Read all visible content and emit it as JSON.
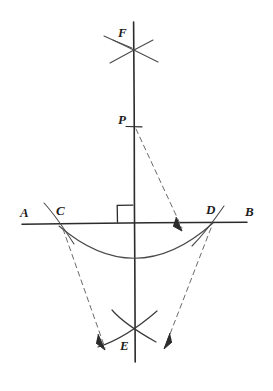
{
  "diagram": {
    "ink_color": "#2b2b2b",
    "label_color": "#1c1c1c",
    "background_color": "#ffffff",
    "canvas": {
      "width": 273,
      "height": 391
    },
    "labels": [
      {
        "id": "F",
        "text": "F",
        "x": 118,
        "y": 26,
        "desc": "upper-arc-intersection-label"
      },
      {
        "id": "P",
        "text": "P",
        "x": 118,
        "y": 113,
        "desc": "point-p-label"
      },
      {
        "id": "A",
        "text": "A",
        "x": 20,
        "y": 206,
        "desc": "line-end-a-label"
      },
      {
        "id": "C",
        "text": "C",
        "x": 56,
        "y": 204,
        "desc": "arc-intersection-c-label"
      },
      {
        "id": "D",
        "text": "D",
        "x": 206,
        "y": 203,
        "desc": "arc-intersection-d-label"
      },
      {
        "id": "B",
        "text": "B",
        "x": 245,
        "y": 205,
        "desc": "line-end-b-label"
      },
      {
        "id": "E",
        "text": "E",
        "x": 120,
        "y": 339,
        "desc": "lower-arc-intersection-label"
      }
    ],
    "elements": {
      "line_ab": {
        "name": "horizontal-line-ab",
        "x1": 22,
        "y1": 224,
        "x2": 247,
        "y2": 222
      },
      "line_fe": {
        "name": "vertical-line-fe",
        "x1": 134,
        "y1": 22,
        "x2": 135,
        "y2": 362
      },
      "right_angle_mark": {
        "name": "right-angle-marker",
        "x": 117,
        "y": 205,
        "w": 16,
        "h": 18
      },
      "arc_cd": {
        "name": "arc-through-c-and-d",
        "from_x": 59,
        "from_y": 226,
        "to_x": 213,
        "to_y": 223,
        "sag": 32
      },
      "point_p": {
        "name": "point-p-marker",
        "x": 134,
        "y": 127
      },
      "point_f": {
        "name": "point-f-crossing",
        "x": 134,
        "y": 49
      },
      "point_e": {
        "name": "point-e-crossing",
        "x": 135,
        "y": 336
      }
    },
    "notes": {
      "construction": "hand-drawn pencil geometry figure",
      "dashed_rays": 3,
      "arrowheads": 3
    }
  }
}
